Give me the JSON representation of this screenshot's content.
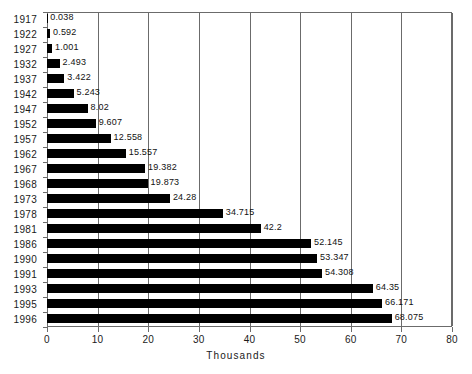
{
  "chart_data": {
    "type": "bar",
    "orientation": "horizontal",
    "title": "",
    "xlabel": "Thousands",
    "ylabel": "",
    "xlim": [
      0,
      80
    ],
    "xticks": [
      0,
      10,
      20,
      30,
      40,
      50,
      60,
      70,
      80
    ],
    "xtick_labels": [
      "0",
      "10",
      "20",
      "30",
      "40",
      "50",
      "60",
      "70",
      "80"
    ],
    "grid": "vertical",
    "legend": "none",
    "bar_color": "#000000",
    "axis_color": "#6b6b6b",
    "categories": [
      "1917",
      "1922",
      "1927",
      "1932",
      "1937",
      "1942",
      "1947",
      "1952",
      "1957",
      "1962",
      "1967",
      "1968",
      "1973",
      "1978",
      "1981",
      "1986",
      "1990",
      "1991",
      "1993",
      "1995",
      "1996"
    ],
    "values": [
      0.038,
      0.592,
      1.001,
      2.493,
      3.422,
      5.243,
      8.02,
      9.607,
      12.558,
      15.557,
      19.382,
      19.873,
      24.28,
      34.715,
      42.2,
      52.145,
      53.347,
      54.308,
      64.35,
      66.171,
      68.075
    ],
    "data_labels": [
      "0.038",
      "0.592",
      "1.001",
      "2.493",
      "3.422",
      "5.243",
      "8.02",
      "9.607",
      "12.558",
      "15.557",
      "19.382",
      "19.873",
      "24.28",
      "34.715",
      "42.2",
      "52.145",
      "53.347",
      "54.308",
      "64.35",
      "66.171",
      "68.075"
    ]
  }
}
